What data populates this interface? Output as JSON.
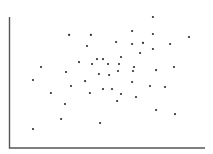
{
  "chart_data": {
    "type": "scatter",
    "title": "",
    "xlabel": "",
    "ylabel": "",
    "xlim": [
      0,
      100
    ],
    "ylim": [
      0,
      100
    ],
    "grid": false,
    "legend": null,
    "ticks": "none",
    "series": [
      {
        "name": "points",
        "color": "#2e2e2e",
        "points": [
          [
            73.3,
            100.0
          ],
          [
            62.6,
            89.3
          ],
          [
            30.3,
            86.3
          ],
          [
            41.5,
            86.3
          ],
          [
            73.3,
            87.0
          ],
          [
            91.8,
            84.7
          ],
          [
            54.4,
            80.9
          ],
          [
            62.6,
            79.4
          ],
          [
            68.2,
            80.2
          ],
          [
            82.1,
            79.4
          ],
          [
            39.5,
            77.9
          ],
          [
            73.3,
            75.6
          ],
          [
            66.7,
            72.5
          ],
          [
            56.9,
            69.5
          ],
          [
            44.6,
            67.9
          ],
          [
            47.7,
            67.9
          ],
          [
            35.4,
            65.6
          ],
          [
            42.1,
            64.1
          ],
          [
            50.3,
            64.1
          ],
          [
            55.9,
            64.1
          ],
          [
            15.9,
            61.8
          ],
          [
            63.6,
            61.8
          ],
          [
            84.1,
            61.8
          ],
          [
            74.9,
            59.5
          ],
          [
            63.1,
            58.8
          ],
          [
            55.4,
            58.8
          ],
          [
            28.7,
            58.0
          ],
          [
            45.6,
            56.5
          ],
          [
            50.8,
            55.7
          ],
          [
            11.8,
            51.9
          ],
          [
            38.5,
            51.1
          ],
          [
            62.6,
            50.4
          ],
          [
            31.3,
            47.3
          ],
          [
            71.8,
            47.3
          ],
          [
            79.5,
            46.6
          ],
          [
            47.7,
            45.0
          ],
          [
            52.3,
            45.0
          ],
          [
            41.0,
            42.0
          ],
          [
            56.9,
            41.2
          ],
          [
            21.0,
            42.0
          ],
          [
            64.6,
            38.9
          ],
          [
            54.9,
            35.9
          ],
          [
            28.2,
            33.6
          ],
          [
            74.9,
            29.0
          ],
          [
            26.2,
            22.1
          ],
          [
            84.6,
            25.9
          ],
          [
            46.2,
            19.1
          ],
          [
            11.8,
            14.5
          ]
        ]
      }
    ]
  },
  "plot_area": {
    "left_px": 10,
    "right_px": 205,
    "top_px": 17,
    "bottom_px": 148
  }
}
